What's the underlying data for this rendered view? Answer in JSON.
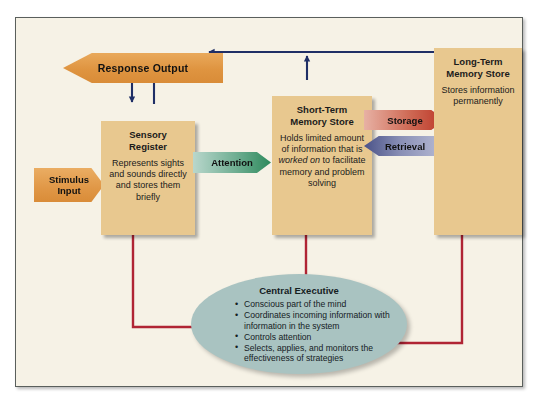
{
  "diagram": {
    "frame_color": "#5a5f5c",
    "canvas_color": "#f6f2e6"
  },
  "tags": {
    "response_output": "Response Output",
    "stimulus_input_line1": "Stimulus",
    "stimulus_input_line2": "Input",
    "attention": "Attention",
    "storage": "Storage",
    "retrieval": "Retrieval"
  },
  "boxes": {
    "sensory": {
      "title_line1": "Sensory",
      "title_line2": "Register",
      "body": "Represents sights and sounds directly and stores them briefly"
    },
    "short_term": {
      "title_line1": "Short-Term",
      "title_line2": "Memory Store",
      "body_part1": "Holds limited amount of information that is ",
      "body_italic": "worked on",
      "body_part2": " to facilitate memory and problem solving"
    },
    "long_term": {
      "title_line1": "Long-Term",
      "title_line2": "Memory Store",
      "body": "Stores information permanently"
    }
  },
  "central_executive": {
    "title": "Central Executive",
    "bullets": [
      "Conscious part of the mind",
      "Coordinates incoming information with information in the system",
      "Controls attention",
      "Selects, applies, and monitors the effectiveness of strategies"
    ]
  },
  "colors": {
    "box_fill": "#e8c88f",
    "oval_fill": "#a9c3c1",
    "navy_arrow": "#1f2f66",
    "red_arrow": "#b02434",
    "orange_tag": "#df9440",
    "green_tag": "#2e8a5c",
    "storage_red": "#bb3526",
    "retrieval_blue": "#4a5288"
  }
}
